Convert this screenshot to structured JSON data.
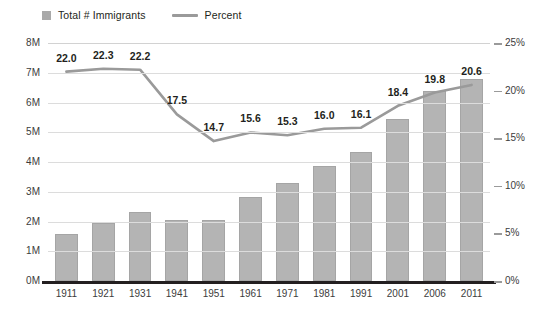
{
  "legend": {
    "items": [
      {
        "label": "Total # Immigrants",
        "marker": "square",
        "color": "#a9a9a9",
        "name": "legend-total-immigrants"
      },
      {
        "label": "Percent",
        "marker": "line",
        "color": "#9a9a9a",
        "name": "legend-percent"
      }
    ]
  },
  "chart_data": {
    "type": "bar",
    "title": "",
    "subtitle": "",
    "xlabel": "",
    "ylabel": "",
    "grid": true,
    "legend_position": "top-left",
    "categories": [
      "1911",
      "1921",
      "1931",
      "1941",
      "1951",
      "1961",
      "1971",
      "1981",
      "1991",
      "2001",
      "2006",
      "2011"
    ],
    "series": [
      {
        "name": "Total # Immigrants",
        "type": "bar",
        "axis": "left",
        "color": "#b4b4b4",
        "values": [
          1.59,
          1.96,
          2.31,
          2.06,
          2.06,
          2.84,
          3.29,
          3.87,
          4.34,
          5.45,
          6.38,
          6.78
        ],
        "unit": "millions"
      },
      {
        "name": "Percent",
        "type": "line",
        "axis": "right",
        "color": "#9a9a9a",
        "values": [
          22.0,
          22.3,
          22.2,
          17.5,
          14.7,
          15.6,
          15.3,
          16.0,
          16.1,
          18.4,
          19.8,
          20.6
        ],
        "labels": [
          "22.0",
          "22.3",
          "22.2",
          "17.5",
          "14.7",
          "15.6",
          "15.3",
          "16.0",
          "16.1",
          "18.4",
          "19.8",
          "20.6"
        ],
        "unit": "percent"
      }
    ],
    "axes": {
      "left": {
        "min": 0,
        "max": 8,
        "step": 1,
        "ticks": [
          "0M",
          "1M",
          "2M",
          "3M",
          "4M",
          "5M",
          "6M",
          "7M",
          "8M"
        ]
      },
      "right": {
        "min": 0,
        "max": 25,
        "step": 5,
        "ticks": [
          "0%",
          "5%",
          "10%",
          "15%",
          "20%",
          "25%"
        ]
      }
    }
  }
}
